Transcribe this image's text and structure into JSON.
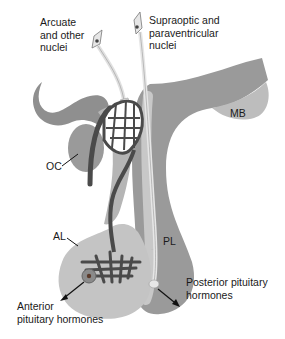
{
  "diagram": {
    "labels": {
      "arcuate": "Arcuate\nand other\nnuclei",
      "supraoptic": "Supraoptic and\nparaventricular\nnuclei",
      "mb": "MB",
      "oc": "OC",
      "al": "AL",
      "pl": "PL",
      "posterior": "Posterior pituitary\nhormones",
      "anterior": "Anterior\npituitary hormones"
    },
    "colors": {
      "dark_tissue": "#8c8c8c",
      "light_tissue": "#bdbdbd",
      "anterior_lobe": "#c4c4c4",
      "posterior_lobe": "#9a9a9a",
      "vessel": "#4a4a4a",
      "neuron": "#e6e6e6",
      "background": "#ffffff"
    }
  }
}
